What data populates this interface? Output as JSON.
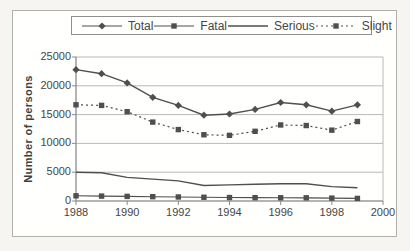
{
  "chart_data": {
    "type": "line",
    "title": "",
    "xlabel": "",
    "ylabel": "Number of persons",
    "x": [
      1988,
      1989,
      1990,
      1991,
      1992,
      1993,
      1994,
      1995,
      1996,
      1997,
      1998,
      1999
    ],
    "xlim": [
      1988,
      2000
    ],
    "ylim": [
      0,
      25000
    ],
    "xticks": [
      1988,
      1990,
      1992,
      1994,
      1996,
      1998,
      2000
    ],
    "yticks": [
      0,
      5000,
      10000,
      15000,
      20000,
      25000
    ],
    "grid": "horizontal",
    "legend_position": "top",
    "series": [
      {
        "name": "Total",
        "marker": "diamond",
        "line_style": "solid",
        "values": [
          22800,
          22100,
          20500,
          18000,
          16600,
          14900,
          15100,
          15900,
          17100,
          16700,
          15600,
          16700
        ]
      },
      {
        "name": "Fatal",
        "marker": "square",
        "line_style": "solid",
        "values": [
          900,
          850,
          800,
          750,
          700,
          650,
          600,
          580,
          560,
          550,
          500,
          450
        ]
      },
      {
        "name": "Serious",
        "marker": "none",
        "line_style": "solid",
        "values": [
          5000,
          4900,
          4100,
          3800,
          3500,
          2700,
          2800,
          2900,
          3000,
          3000,
          2500,
          2300
        ]
      },
      {
        "name": "Slight",
        "marker": "square",
        "line_style": "dotted",
        "values": [
          16700,
          16600,
          15500,
          13700,
          12400,
          11500,
          11400,
          12100,
          13200,
          13100,
          12300,
          13800
        ]
      }
    ],
    "colors": {
      "line": "#4f4f4f",
      "grid": "#b9b9b9",
      "axis": "#8b8b8b",
      "text": "#454545",
      "frame": "#b3b0ab",
      "plot_background": "#fffffe",
      "page_background": "#f6f5f2"
    }
  }
}
